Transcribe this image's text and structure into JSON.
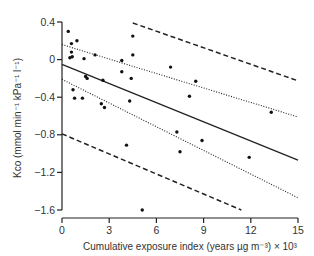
{
  "chart_data": {
    "type": "scatter",
    "title": "",
    "xlabel": "Cumulative exposure index (years µg m⁻³) × 10³",
    "ylabel": "Kco (mmol min⁻¹ kPa⁻¹ l⁻¹)",
    "xlim": [
      0,
      15
    ],
    "ylim": [
      -1.6,
      0.4
    ],
    "xticks": [
      0,
      3,
      6,
      9,
      12,
      15
    ],
    "xtick_labels": [
      "0",
      "3",
      "6",
      "9",
      "12",
      "15"
    ],
    "yticks": [
      0.4,
      0,
      -0.4,
      -0.8,
      -1.2,
      -1.6
    ],
    "ytick_labels": [
      "0.4",
      "0",
      "−0.4",
      "−0.8",
      "−1.2",
      "−1.6"
    ],
    "grid": false,
    "legend": null,
    "points": [
      {
        "x": 0.4,
        "y": 0.3
      },
      {
        "x": 0.6,
        "y": 0.17
      },
      {
        "x": 0.95,
        "y": 0.2
      },
      {
        "x": 0.6,
        "y": 0.08
      },
      {
        "x": 0.5,
        "y": 0.02
      },
      {
        "x": 0.65,
        "y": 0.03
      },
      {
        "x": 1.4,
        "y": 0.01
      },
      {
        "x": 2.1,
        "y": 0.05
      },
      {
        "x": 1.5,
        "y": -0.18
      },
      {
        "x": 1.6,
        "y": -0.2
      },
      {
        "x": 2.6,
        "y": -0.22
      },
      {
        "x": 0.7,
        "y": -0.32
      },
      {
        "x": 0.8,
        "y": -0.41
      },
      {
        "x": 1.3,
        "y": -0.41
      },
      {
        "x": 2.5,
        "y": -0.47
      },
      {
        "x": 2.7,
        "y": -0.51
      },
      {
        "x": 3.8,
        "y": -0.01
      },
      {
        "x": 3.8,
        "y": -0.13
      },
      {
        "x": 4.5,
        "y": 0.25
      },
      {
        "x": 4.5,
        "y": 0.05
      },
      {
        "x": 4.4,
        "y": -0.2
      },
      {
        "x": 4.3,
        "y": -0.44
      },
      {
        "x": 4.1,
        "y": -0.91
      },
      {
        "x": 5.1,
        "y": -1.6
      },
      {
        "x": 6.9,
        "y": -0.08
      },
      {
        "x": 8.5,
        "y": -0.23
      },
      {
        "x": 8.1,
        "y": -0.39
      },
      {
        "x": 7.3,
        "y": -0.77
      },
      {
        "x": 7.5,
        "y": -0.98
      },
      {
        "x": 8.9,
        "y": -0.86
      },
      {
        "x": 13.3,
        "y": -0.56
      },
      {
        "x": 11.9,
        "y": -1.04
      }
    ],
    "lines": [
      {
        "name": "regression",
        "style": "solid",
        "x": [
          0,
          15
        ],
        "y": [
          -0.05,
          -1.07
        ]
      },
      {
        "name": "confidence-upper",
        "style": "dotted",
        "x": [
          0,
          15
        ],
        "y": [
          0.16,
          -0.61
        ]
      },
      {
        "name": "confidence-lower",
        "style": "dotted",
        "x": [
          0,
          15
        ],
        "y": [
          -0.21,
          -1.47
        ]
      },
      {
        "name": "prediction-upper",
        "style": "dashed",
        "x": [
          4.5,
          14.9
        ],
        "y": [
          0.39,
          -0.22
        ]
      },
      {
        "name": "prediction-lower",
        "style": "dashed",
        "x": [
          0,
          11.4
        ],
        "y": [
          -0.79,
          -1.6
        ]
      }
    ]
  },
  "layout": {
    "plot": {
      "x0": 62,
      "x1": 298,
      "y_top": 22,
      "y_bottom": 210,
      "xaxis_y": 218,
      "yaxis_x": 62
    },
    "colors": {
      "ink": "#222222",
      "text": "#333333"
    }
  }
}
